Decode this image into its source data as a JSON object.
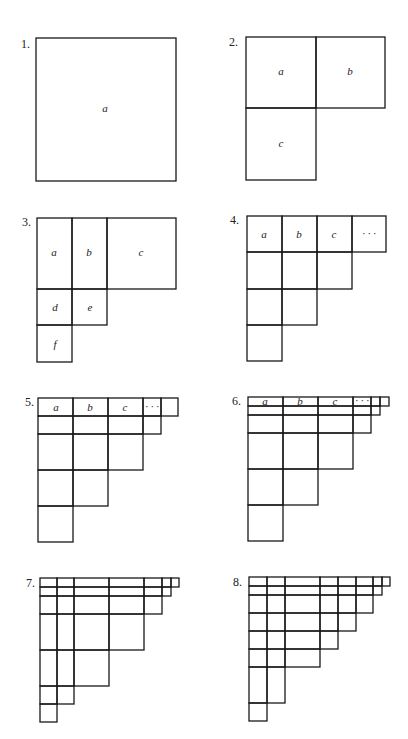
{
  "figure": {
    "panels": [
      {
        "number": "1.",
        "num_pos": [
          21,
          48
        ],
        "rects": [
          [
            36,
            38,
            176,
            181
          ]
        ],
        "labels": [
          {
            "t": "a",
            "x": 105,
            "y": 112
          }
        ]
      },
      {
        "number": "2.",
        "num_pos": [
          229,
          46
        ],
        "rects": [
          [
            246,
            37,
            316,
            108
          ],
          [
            316,
            37,
            385,
            108
          ],
          [
            246,
            108,
            316,
            180
          ]
        ],
        "labels": [
          {
            "t": "a",
            "x": 281,
            "y": 75
          },
          {
            "t": "b",
            "x": 350,
            "y": 75
          },
          {
            "t": "c",
            "x": 281,
            "y": 147
          }
        ]
      },
      {
        "number": "3.",
        "num_pos": [
          22,
          226
        ],
        "rects": [
          [
            37,
            218,
            72,
            289
          ],
          [
            72,
            218,
            107,
            289
          ],
          [
            107,
            218,
            176,
            289
          ],
          [
            37,
            289,
            72,
            325
          ],
          [
            72,
            289,
            107,
            325
          ],
          [
            37,
            325,
            72,
            362
          ]
        ],
        "labels": [
          {
            "t": "a",
            "x": 54,
            "y": 256
          },
          {
            "t": "b",
            "x": 89,
            "y": 256
          },
          {
            "t": "c",
            "x": 141,
            "y": 256
          },
          {
            "t": "d",
            "x": 55,
            "y": 311
          },
          {
            "t": "e",
            "x": 90,
            "y": 311
          },
          {
            "t": "f",
            "x": 55,
            "y": 348
          }
        ]
      },
      {
        "number": "4.",
        "num_pos": [
          230,
          224
        ],
        "rects": [
          [
            247,
            216,
            282,
            252
          ],
          [
            282,
            216,
            317,
            252
          ],
          [
            317,
            216,
            352,
            252
          ],
          [
            352,
            216,
            386,
            252
          ],
          [
            247,
            252,
            282,
            289
          ],
          [
            282,
            252,
            317,
            289
          ],
          [
            317,
            252,
            352,
            289
          ],
          [
            247,
            289,
            282,
            325
          ],
          [
            282,
            289,
            317,
            325
          ],
          [
            247,
            325,
            282,
            361
          ]
        ],
        "labels": [
          {
            "t": "a",
            "x": 264,
            "y": 238
          },
          {
            "t": "b",
            "x": 299,
            "y": 238
          },
          {
            "t": "c",
            "x": 334,
            "y": 238
          },
          {
            "t": "· · ·",
            "x": 369,
            "y": 237
          }
        ]
      },
      {
        "number": "5.",
        "num_pos": [
          25,
          406
        ],
        "rects": [
          [
            38,
            398,
            73,
            416
          ],
          [
            73,
            398,
            108,
            416
          ],
          [
            108,
            398,
            143,
            416
          ],
          [
            143,
            398,
            161,
            416
          ],
          [
            161,
            398,
            178,
            416
          ],
          [
            38,
            416,
            73,
            434
          ],
          [
            73,
            416,
            108,
            434
          ],
          [
            108,
            416,
            143,
            434
          ],
          [
            143,
            416,
            161,
            434
          ],
          [
            38,
            434,
            73,
            470
          ],
          [
            73,
            434,
            108,
            470
          ],
          [
            108,
            434,
            143,
            470
          ],
          [
            38,
            470,
            73,
            506
          ],
          [
            73,
            470,
            108,
            506
          ],
          [
            38,
            506,
            73,
            542
          ]
        ],
        "labels": [
          {
            "t": "a",
            "x": 56,
            "y": 411
          },
          {
            "t": "b",
            "x": 90,
            "y": 411
          },
          {
            "t": "c",
            "x": 125,
            "y": 411
          },
          {
            "t": "· · ·",
            "x": 152,
            "y": 410
          }
        ]
      },
      {
        "number": "6.",
        "num_pos": [
          232,
          405
        ],
        "rects": [
          [
            248,
            397,
            283,
            406
          ],
          [
            283,
            397,
            318,
            406
          ],
          [
            318,
            397,
            353,
            406
          ],
          [
            353,
            397,
            371,
            406
          ],
          [
            371,
            397,
            380,
            406
          ],
          [
            380,
            397,
            389,
            406
          ],
          [
            248,
            406,
            283,
            415
          ],
          [
            283,
            406,
            318,
            415
          ],
          [
            318,
            406,
            353,
            415
          ],
          [
            353,
            406,
            371,
            415
          ],
          [
            371,
            406,
            380,
            415
          ],
          [
            248,
            415,
            283,
            433
          ],
          [
            283,
            415,
            318,
            433
          ],
          [
            318,
            415,
            353,
            433
          ],
          [
            353,
            415,
            371,
            433
          ],
          [
            248,
            433,
            283,
            469
          ],
          [
            283,
            433,
            318,
            469
          ],
          [
            318,
            433,
            353,
            469
          ],
          [
            248,
            469,
            283,
            505
          ],
          [
            283,
            469,
            318,
            505
          ],
          [
            248,
            505,
            283,
            541
          ]
        ],
        "labels": [
          {
            "t": "a",
            "x": 265,
            "y": 405
          },
          {
            "t": "b",
            "x": 300,
            "y": 405
          },
          {
            "t": "c",
            "x": 335,
            "y": 405
          },
          {
            "t": "· · ·",
            "x": 362,
            "y": 404
          }
        ]
      },
      {
        "number": "7.",
        "num_pos": [
          26,
          587
        ],
        "rects": [
          [
            40,
            578,
            57,
            587
          ],
          [
            57,
            578,
            74,
            587
          ],
          [
            74,
            578,
            109,
            587
          ],
          [
            109,
            578,
            144,
            587
          ],
          [
            144,
            578,
            162,
            587
          ],
          [
            162,
            578,
            171,
            587
          ],
          [
            171,
            578,
            179,
            587
          ],
          [
            40,
            587,
            57,
            596
          ],
          [
            57,
            587,
            74,
            596
          ],
          [
            74,
            587,
            109,
            596
          ],
          [
            109,
            587,
            144,
            596
          ],
          [
            144,
            587,
            162,
            596
          ],
          [
            162,
            587,
            171,
            596
          ],
          [
            40,
            596,
            57,
            614
          ],
          [
            57,
            596,
            74,
            614
          ],
          [
            74,
            596,
            109,
            614
          ],
          [
            109,
            596,
            144,
            614
          ],
          [
            144,
            596,
            162,
            614
          ],
          [
            40,
            614,
            57,
            650
          ],
          [
            57,
            614,
            74,
            650
          ],
          [
            74,
            614,
            109,
            650
          ],
          [
            109,
            614,
            144,
            650
          ],
          [
            40,
            650,
            57,
            686
          ],
          [
            57,
            650,
            74,
            686
          ],
          [
            74,
            650,
            109,
            686
          ],
          [
            40,
            686,
            57,
            704
          ],
          [
            57,
            686,
            74,
            704
          ],
          [
            40,
            704,
            57,
            722
          ]
        ],
        "labels": []
      },
      {
        "number": "8.",
        "num_pos": [
          233,
          586
        ],
        "rects": [
          [
            249,
            577,
            267,
            586
          ],
          [
            267,
            577,
            285,
            586
          ],
          [
            285,
            577,
            320,
            586
          ],
          [
            320,
            577,
            338,
            586
          ],
          [
            338,
            577,
            356,
            586
          ],
          [
            356,
            577,
            373,
            586
          ],
          [
            373,
            577,
            382,
            586
          ],
          [
            382,
            577,
            390,
            586
          ],
          [
            249,
            586,
            267,
            595
          ],
          [
            267,
            586,
            285,
            595
          ],
          [
            285,
            586,
            320,
            595
          ],
          [
            320,
            586,
            338,
            595
          ],
          [
            338,
            586,
            356,
            595
          ],
          [
            356,
            586,
            373,
            595
          ],
          [
            373,
            586,
            382,
            595
          ],
          [
            249,
            595,
            267,
            613
          ],
          [
            267,
            595,
            285,
            613
          ],
          [
            285,
            595,
            320,
            613
          ],
          [
            320,
            595,
            338,
            613
          ],
          [
            338,
            595,
            356,
            613
          ],
          [
            356,
            595,
            373,
            613
          ],
          [
            249,
            613,
            267,
            631
          ],
          [
            267,
            613,
            285,
            631
          ],
          [
            285,
            613,
            320,
            631
          ],
          [
            320,
            613,
            338,
            631
          ],
          [
            338,
            613,
            356,
            631
          ],
          [
            249,
            631,
            267,
            649
          ],
          [
            267,
            631,
            285,
            649
          ],
          [
            285,
            631,
            320,
            649
          ],
          [
            320,
            631,
            338,
            649
          ],
          [
            249,
            649,
            267,
            667
          ],
          [
            267,
            649,
            285,
            667
          ],
          [
            285,
            649,
            320,
            667
          ],
          [
            249,
            667,
            267,
            703
          ],
          [
            267,
            667,
            285,
            703
          ],
          [
            249,
            703,
            267,
            721
          ]
        ],
        "labels": []
      }
    ]
  }
}
